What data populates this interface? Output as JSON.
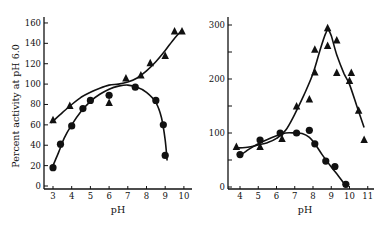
{
  "chart_data": [
    {
      "type": "scatter",
      "title": "",
      "xlabel": "pH",
      "ylabel": "Percent activity at pH 6.0",
      "xlim": [
        2.5,
        10.5
      ],
      "ylim": [
        0,
        165
      ],
      "xticks": [
        3,
        4,
        5,
        6,
        7,
        8,
        9,
        10
      ],
      "yticks": [
        0,
        20,
        40,
        60,
        80,
        100,
        120,
        140,
        160
      ],
      "grid": false,
      "series": [
        {
          "name": "triangles",
          "marker": "triangle",
          "points": [
            [
              3.0,
              65
            ],
            [
              3.9,
              79
            ],
            [
              6.0,
              82
            ],
            [
              6.9,
              106
            ],
            [
              7.7,
              109
            ],
            [
              8.2,
              121
            ],
            [
              9.0,
              128
            ],
            [
              9.5,
              152
            ],
            [
              9.9,
              152
            ]
          ],
          "curve": [
            [
              2.9,
              62
            ],
            [
              3.5,
              72
            ],
            [
              4,
              80
            ],
            [
              4.5,
              87
            ],
            [
              5,
              92
            ],
            [
              5.5,
              96
            ],
            [
              6,
              99
            ],
            [
              6.5,
              100
            ],
            [
              7,
              102
            ],
            [
              7.5,
              106
            ],
            [
              8,
              113
            ],
            [
              8.5,
              122
            ],
            [
              9,
              133
            ],
            [
              9.5,
              145
            ],
            [
              9.9,
              153
            ]
          ]
        },
        {
          "name": "circles",
          "marker": "circle",
          "points": [
            [
              3.0,
              18
            ],
            [
              3.4,
              41
            ],
            [
              4.0,
              59
            ],
            [
              4.6,
              76
            ],
            [
              5.0,
              84
            ],
            [
              6.0,
              89
            ],
            [
              7.4,
              97
            ],
            [
              8.5,
              84
            ],
            [
              8.9,
              60
            ],
            [
              9.0,
              30
            ]
          ],
          "curve": [
            [
              3.0,
              20
            ],
            [
              3.3,
              33
            ],
            [
              3.6,
              47
            ],
            [
              4,
              60
            ],
            [
              4.5,
              73
            ],
            [
              5,
              83
            ],
            [
              5.5,
              90
            ],
            [
              6,
              95
            ],
            [
              6.5,
              98
            ],
            [
              7,
              99
            ],
            [
              7.5,
              97
            ],
            [
              8,
              92
            ],
            [
              8.5,
              82
            ],
            [
              8.8,
              67
            ],
            [
              9.0,
              45
            ],
            [
              9.1,
              25
            ]
          ]
        }
      ]
    },
    {
      "type": "scatter",
      "title": "",
      "xlabel": "pH",
      "ylabel": "",
      "xlim": [
        3.5,
        11.2
      ],
      "ylim": [
        0,
        310
      ],
      "xticks": [
        4,
        5,
        6,
        7,
        8,
        9,
        10,
        11
      ],
      "yticks": [
        0,
        50,
        100,
        150,
        200,
        250,
        300
      ],
      "ytick_labels": [
        "0",
        "",
        "100",
        "",
        "200",
        "",
        "300"
      ],
      "grid": false,
      "series": [
        {
          "name": "triangles",
          "marker": "triangle",
          "points": [
            [
              3.8,
              75
            ],
            [
              5.1,
              75
            ],
            [
              6.3,
              90
            ],
            [
              7.1,
              150
            ],
            [
              7.8,
              163
            ],
            [
              8.1,
              255
            ],
            [
              8.1,
              213
            ],
            [
              8.8,
              295
            ],
            [
              8.8,
              262
            ],
            [
              9.3,
              272
            ],
            [
              9.3,
              212
            ],
            [
              10.0,
              197
            ],
            [
              10.1,
              212
            ],
            [
              10.5,
              142
            ],
            [
              10.8,
              88
            ]
          ],
          "curve": [
            [
              3.8,
              72
            ],
            [
              4.5,
              74
            ],
            [
              5,
              78
            ],
            [
              5.5,
              82
            ],
            [
              6,
              90
            ],
            [
              6.5,
              105
            ],
            [
              7,
              135
            ],
            [
              7.5,
              170
            ],
            [
              8,
              210
            ],
            [
              8.4,
              255
            ],
            [
              8.7,
              285
            ],
            [
              8.85,
              290
            ],
            [
              9.0,
              280
            ],
            [
              9.3,
              245
            ],
            [
              9.7,
              210
            ],
            [
              10,
              190
            ],
            [
              10.4,
              150
            ],
            [
              10.8,
              110
            ]
          ]
        },
        {
          "name": "circles",
          "marker": "circle",
          "points": [
            [
              4.0,
              60
            ],
            [
              5.1,
              87
            ],
            [
              6.2,
              100
            ],
            [
              7.1,
              100
            ],
            [
              7.8,
              105
            ],
            [
              8.1,
              80
            ],
            [
              8.7,
              48
            ],
            [
              9.2,
              38
            ],
            [
              9.8,
              5
            ]
          ],
          "curve": [
            [
              4.0,
              58
            ],
            [
              4.5,
              70
            ],
            [
              5,
              80
            ],
            [
              5.5,
              88
            ],
            [
              6,
              95
            ],
            [
              6.5,
              100
            ],
            [
              7,
              100
            ],
            [
              7.4,
              99
            ],
            [
              7.8,
              92
            ],
            [
              8.1,
              80
            ],
            [
              8.5,
              60
            ],
            [
              9,
              37
            ],
            [
              9.4,
              20
            ],
            [
              9.8,
              2
            ]
          ]
        }
      ]
    }
  ]
}
